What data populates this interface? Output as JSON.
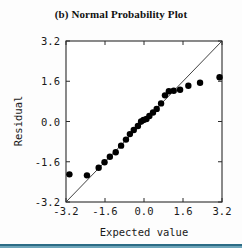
{
  "figure": {
    "title": "(b) Normal Probability Plot",
    "bottom_rule_color": "#2d6d86"
  },
  "chart_data": {
    "type": "scatter",
    "title": "(b) Normal Probability Plot",
    "xlabel": "Expected value",
    "ylabel": "Residual",
    "xlim": [
      -3.2,
      3.2
    ],
    "ylim": [
      -3.2,
      3.2
    ],
    "xticks": [
      "-3.2",
      "-1.6",
      "0.0",
      "1.6",
      "3.2"
    ],
    "yticks": [
      "-3.2",
      "-1.6",
      "0.0",
      "1.6",
      "3.2"
    ],
    "xtick_values": [
      -3.2,
      -1.6,
      0.0,
      1.6,
      3.2
    ],
    "ytick_values": [
      -3.2,
      -1.6,
      0.0,
      1.6,
      3.2
    ],
    "grid": false,
    "legend": false,
    "reference_line": {
      "label": "45-degree reference line",
      "x": [
        -3.2,
        3.2
      ],
      "y": [
        -3.2,
        3.2
      ]
    },
    "marker": {
      "shape": "circle",
      "color": "#000000",
      "size": 3.2
    },
    "series": [
      {
        "name": "Residuals",
        "x": [
          -3.06,
          -2.34,
          -1.86,
          -1.62,
          -1.4,
          -1.16,
          -0.94,
          -0.74,
          -0.58,
          -0.42,
          -0.25,
          -0.12,
          -0.02,
          0.1,
          0.22,
          0.37,
          0.52,
          0.7,
          0.86,
          1.02,
          1.22,
          1.48,
          1.82,
          2.3,
          3.1
        ],
        "y": [
          -2.1,
          -2.14,
          -1.84,
          -1.62,
          -1.4,
          -1.22,
          -0.96,
          -0.72,
          -0.5,
          -0.34,
          -0.18,
          0.0,
          0.06,
          0.1,
          0.22,
          0.36,
          0.5,
          0.72,
          1.04,
          1.2,
          1.22,
          1.26,
          1.42,
          1.54,
          1.76
        ]
      }
    ]
  }
}
